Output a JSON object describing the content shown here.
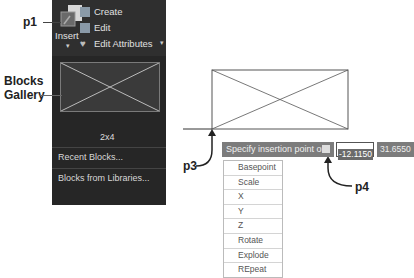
{
  "callouts": {
    "p1": "p1",
    "p3": "p3",
    "p4": "p4",
    "blocks_gallery_line1": "Blocks",
    "blocks_gallery_line2": "Gallery"
  },
  "ribbon": {
    "insert_label": "Insert",
    "items": [
      {
        "label": "Create",
        "icon": "create-block-icon"
      },
      {
        "label": "Edit",
        "icon": "edit-block-icon"
      },
      {
        "label": "Edit Attributes",
        "icon": "edit-attributes-icon"
      }
    ]
  },
  "gallery": {
    "block_name": "2x4",
    "links": [
      "Recent Blocks...",
      "Blocks from Libraries..."
    ]
  },
  "prompt": {
    "text": "Specify insertion point or",
    "x_value": "-12.1150",
    "y_value": "31.6550"
  },
  "options_menu": [
    "Basepoint",
    "Scale",
    "X",
    "Y",
    "Z",
    "Rotate",
    "Explode",
    "REpeat"
  ],
  "colors": {
    "ribbon_bg": "#2f2f2f",
    "gallery_bg": "#262626",
    "prompt_bg": "#7c7c7c"
  }
}
